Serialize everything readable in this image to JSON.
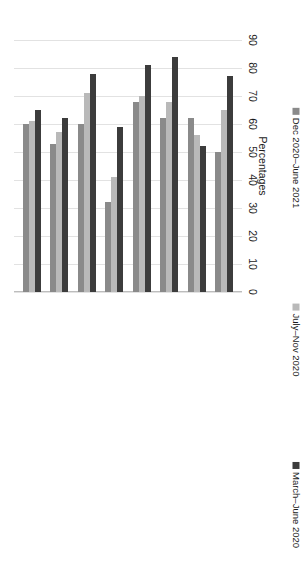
{
  "chart_data": {
    "type": "bar",
    "orientation": "vertical-rotated",
    "title": "",
    "xlabel": "",
    "ylabel": "Percentages",
    "ylim": [
      0,
      90
    ],
    "yticks": [
      0,
      10,
      20,
      30,
      40,
      50,
      60,
      70,
      80,
      90
    ],
    "grid": true,
    "legend_position": "bottom",
    "categories": [
      "The pandemic resulted in some groups of people being more likely to be excluded from volunteering",
      "The kinds of people who volunteer in my area changed",
      "More people were volunteering in places of higher deprivation within the local area where we operate",
      "New voluntary/community organisations emerged in my area in response to the pandemic",
      "There was more informal volunteering in my area than before the pandemic",
      "People got involved in volunteering in my area who were not volunteering before",
      "Existing volunteers were unable or reluctant to do their usual volunteering due to the pandemic",
      "More people were volunteering in my area than usual"
    ],
    "series": [
      {
        "name": "Dec 2020–June 2021",
        "color": "#8a8a8a",
        "values": [
          60,
          53,
          60,
          32,
          68,
          62,
          62,
          50
        ]
      },
      {
        "name": "July–Nov 2020",
        "color": "#b9b9b9",
        "values": [
          61,
          57,
          71,
          41,
          70,
          68,
          56,
          65
        ]
      },
      {
        "name": "March–June 2020",
        "color": "#3c3c3c",
        "values": [
          65,
          62,
          78,
          59,
          81,
          84,
          52,
          77
        ]
      }
    ]
  },
  "axis": {
    "value_axis_title": "Percentages",
    "tick_labels": [
      "0",
      "10",
      "20",
      "30",
      "40",
      "50",
      "60",
      "70",
      "80",
      "90"
    ]
  },
  "legend": {
    "items": [
      {
        "label": "Dec 2020–June 2021",
        "color": "#8a8a8a",
        "swatch_name": "legend-swatch-dec-2020-june-2021"
      },
      {
        "label": "July–Nov 2020",
        "color": "#b9b9b9",
        "swatch_name": "legend-swatch-july-nov-2020"
      },
      {
        "label": "March–June 2020",
        "color": "#3c3c3c",
        "swatch_name": "legend-swatch-march-june-2020"
      }
    ]
  }
}
